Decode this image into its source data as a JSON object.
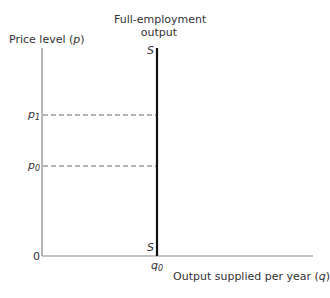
{
  "diagram": {
    "title_top": [
      "Full-employment",
      "output"
    ],
    "y_axis_label": "Price level",
    "y_axis_var": "p",
    "x_axis_label": "Output supplied per year",
    "x_axis_var": "q",
    "origin_label": "0",
    "supply_curve_label_top": "S",
    "supply_curve_label_bottom": "S",
    "y_ticks": [
      {
        "base": "p",
        "sub": "1"
      },
      {
        "base": "p",
        "sub": "0"
      }
    ],
    "x_ticks": [
      {
        "base": "q",
        "sub": "0"
      }
    ]
  },
  "colors": {
    "axis": "#888888",
    "supply_line": "#111111",
    "dashes": "#555555",
    "text": "#333333"
  }
}
